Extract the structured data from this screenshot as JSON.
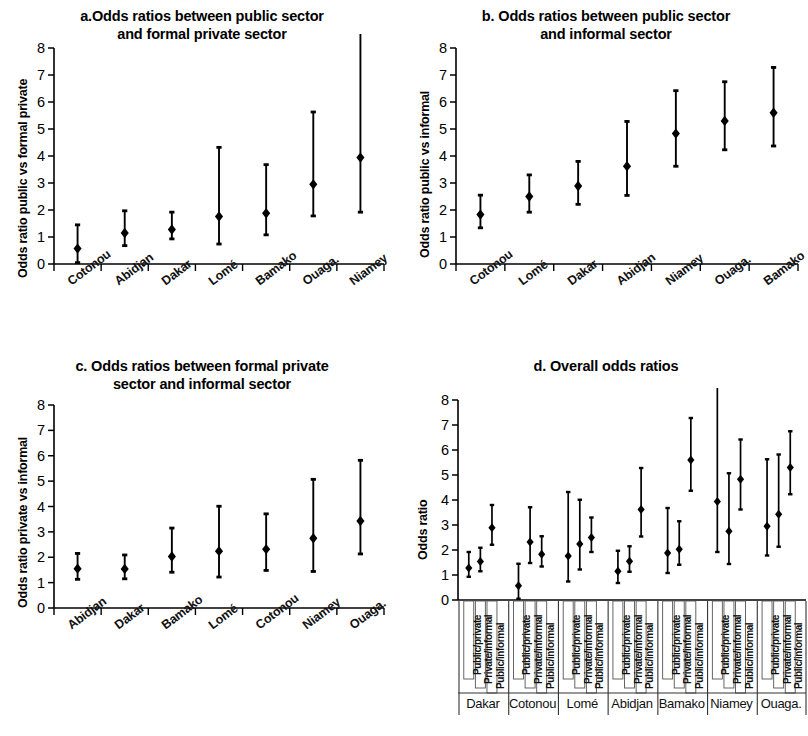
{
  "figure": {
    "axis_color": "#000000",
    "marker_color": "#000000",
    "background": "#ffffff"
  },
  "panels": {
    "a": {
      "title_line1": "a.Odds ratios between public sector",
      "title_line2": "and formal private sector",
      "ylabel": "Odds ratio public vs formal private",
      "yticks": [
        "0",
        "1",
        "2",
        "3",
        "4",
        "5",
        "6",
        "7",
        "8"
      ]
    },
    "b": {
      "title_line1": "b. Odds ratios between public sector",
      "title_line2": "and informal sector",
      "ylabel": "Odds ratio public vs informal",
      "yticks": [
        "0",
        "1",
        "2",
        "3",
        "4",
        "5",
        "6",
        "7",
        "8"
      ]
    },
    "c": {
      "title_line1": "c. Odds ratios between formal private",
      "title_line2": "sector and informal sector",
      "ylabel": "Odds ratio private vs informal",
      "yticks": [
        "0",
        "1",
        "2",
        "3",
        "4",
        "5",
        "6",
        "7",
        "8"
      ]
    },
    "d": {
      "title_line1": "d. Overall odds ratios",
      "title_line2": "",
      "ylabel": "Odds ratio",
      "yticks": [
        "0",
        "1",
        "2",
        "3",
        "4",
        "5",
        "6",
        "7",
        "8"
      ]
    }
  },
  "chart_data": [
    {
      "panel": "a",
      "type": "scatter",
      "title": "a.Odds ratios between public sector and formal private sector",
      "xlabel": "",
      "ylabel": "Odds ratio public vs formal private",
      "ylim": [
        0,
        8
      ],
      "grid": false,
      "legend": "none",
      "error_bars": "95% CI",
      "categories": [
        "Cotonou",
        "Abidjan",
        "Dakar",
        "Lomé",
        "Bamako",
        "Ouaga.",
        "Niamey"
      ],
      "values": [
        0.57,
        1.15,
        1.28,
        1.76,
        1.88,
        2.95,
        3.94
      ],
      "ci_low": [
        0.05,
        0.68,
        0.93,
        0.74,
        1.08,
        1.78,
        1.92
      ],
      "ci_high": [
        1.45,
        1.97,
        1.92,
        4.32,
        3.68,
        5.63,
        9.2
      ]
    },
    {
      "panel": "b",
      "type": "scatter",
      "title": "b. Odds ratios between public sector and informal sector",
      "xlabel": "",
      "ylabel": "Odds ratio public vs informal",
      "ylim": [
        0,
        8
      ],
      "grid": false,
      "legend": "none",
      "error_bars": "95% CI",
      "categories": [
        "Cotonou",
        "Lomé",
        "Dakar",
        "Abidjan",
        "Niamey",
        "Ouaga.",
        "Bamako"
      ],
      "values": [
        1.83,
        2.5,
        2.89,
        3.62,
        4.83,
        5.3,
        5.6
      ],
      "ci_low": [
        1.34,
        1.92,
        2.21,
        2.54,
        3.62,
        4.23,
        4.37
      ],
      "ci_high": [
        2.55,
        3.3,
        3.8,
        5.28,
        6.42,
        6.75,
        7.28
      ]
    },
    {
      "panel": "c",
      "type": "scatter",
      "title": "c. Odds ratios between formal private sector and informal sector",
      "xlabel": "",
      "ylabel": "Odds ratio private vs informal",
      "ylim": [
        0,
        8
      ],
      "grid": false,
      "legend": "none",
      "error_bars": "95% CI",
      "categories": [
        "Abidjan",
        "Dakar",
        "Bamako",
        "Lomé",
        "Cotonou",
        "Niamey",
        "Ouaga."
      ],
      "values": [
        1.55,
        1.54,
        2.03,
        2.24,
        2.32,
        2.75,
        3.43
      ],
      "ci_low": [
        1.13,
        1.15,
        1.41,
        1.22,
        1.48,
        1.44,
        2.13
      ],
      "ci_high": [
        2.15,
        2.09,
        3.15,
        4.01,
        3.71,
        5.07,
        5.82
      ]
    },
    {
      "panel": "d",
      "type": "scatter",
      "title": "d. Overall odds ratios",
      "xlabel": "",
      "ylabel": "Odds ratio",
      "ylim": [
        0,
        8
      ],
      "grid": false,
      "legend": "none",
      "error_bars": "95% CI",
      "comparisons": [
        "Public/private",
        "Private/informal",
        "Public/informal"
      ],
      "groups": [
        "Dakar",
        "Cotonou",
        "Lomé",
        "Abidjan",
        "Bamako",
        "Niamey",
        "Ouaga."
      ],
      "series": [
        {
          "name": "Public/private",
          "values": [
            1.28,
            0.57,
            1.76,
            1.15,
            1.88,
            3.94,
            2.95
          ],
          "ci_low": [
            0.93,
            0.05,
            0.74,
            0.68,
            1.08,
            1.92,
            1.78
          ],
          "ci_high": [
            1.92,
            1.45,
            4.32,
            1.97,
            3.68,
            9.2,
            5.63
          ]
        },
        {
          "name": "Private/informal",
          "values": [
            1.54,
            2.32,
            2.24,
            1.55,
            2.03,
            2.75,
            3.43
          ],
          "ci_low": [
            1.15,
            1.48,
            1.22,
            1.13,
            1.41,
            1.44,
            2.13
          ],
          "ci_high": [
            2.09,
            3.71,
            4.01,
            2.15,
            3.15,
            5.07,
            5.82
          ]
        },
        {
          "name": "Public/informal",
          "values": [
            2.89,
            1.83,
            2.5,
            3.62,
            5.6,
            4.83,
            5.3
          ],
          "ci_low": [
            2.21,
            1.34,
            1.92,
            2.54,
            4.37,
            3.62,
            4.23
          ],
          "ci_high": [
            3.8,
            2.55,
            3.3,
            5.28,
            7.28,
            6.42,
            6.75
          ]
        }
      ]
    }
  ]
}
